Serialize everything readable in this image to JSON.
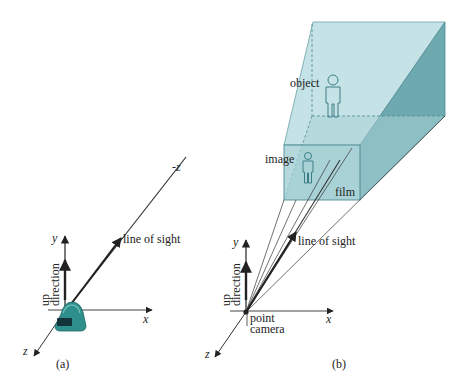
{
  "panel_a": {
    "caption": "(a)",
    "labels": {
      "neg_z": "-z",
      "line_of_sight": "line of sight",
      "y_axis": "y",
      "x_axis": "x",
      "z_axis": "z",
      "up_direction_line1": "up",
      "up_direction_line2": "direction"
    },
    "icons": {
      "camera": "camera-icon"
    }
  },
  "panel_b": {
    "caption": "(b)",
    "labels": {
      "object": "object",
      "image": "image",
      "film": "film",
      "line_of_sight": "line of sight",
      "y_axis": "y",
      "x_axis": "x",
      "z_axis": "z",
      "up_direction_line1": "up",
      "up_direction_line2": "direction",
      "point_camera_line1": "point",
      "point_camera_line2": "camera"
    },
    "icons": {
      "object_figure": "person-icon",
      "image_figure": "person-icon"
    }
  },
  "colors": {
    "frustum_light": "#c5e2e6",
    "frustum_mid": "#a9d2d7",
    "frustum_dark": "#6ea9b0",
    "film": "#9ccbd0",
    "edge": "#4f8c93",
    "camera_body": "#2f8f8c",
    "camera_dark": "#13343a",
    "ink": "#222222"
  }
}
